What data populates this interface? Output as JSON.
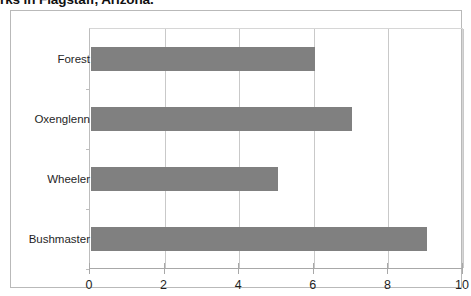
{
  "chart_data": {
    "type": "bar",
    "orientation": "horizontal",
    "title": "rks in Flagstaff, Arizona.",
    "xlabel": "",
    "ylabel": "",
    "categories": [
      "Forest",
      "Oxenglenn",
      "Wheeler",
      "Bushmaster"
    ],
    "values": [
      6,
      7,
      5,
      9
    ],
    "series": [
      {
        "name": "",
        "values": [
          6,
          7,
          5,
          9
        ]
      }
    ],
    "xlim": [
      0,
      10
    ],
    "xticks": [
      0,
      2,
      4,
      6,
      8,
      10
    ],
    "xtick_labels": [
      "0",
      "2",
      "4",
      "6",
      "8",
      "10"
    ],
    "grid": "vertical",
    "legend": "none",
    "bar_color": "#808080",
    "gridline_color": "#c9c9c9",
    "axis_color": "#a8a8a8",
    "frame_color": "#b9b9b9",
    "text_color": "#1f1f1f"
  }
}
